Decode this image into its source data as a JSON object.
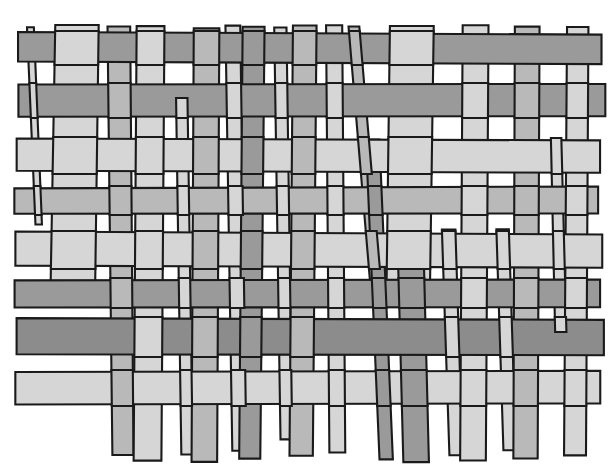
{
  "artwork": {
    "title": "Woven Basket Weave Pattern",
    "type": "illustration",
    "description": "Hand-drawn plain weave of interlacing vertical and horizontal paper strips",
    "canvas": {
      "width": 615,
      "height": 471,
      "background": "#ffffff"
    },
    "palette": {
      "outline": "#1a1a1a",
      "tone_light": "#d6d6d6",
      "tone_medium": "#b9b9b9",
      "tone_dark": "#9a9a9a",
      "tone_darker": "#8c8c8c",
      "background": "#ffffff"
    },
    "weave": {
      "structure": "plain-weave",
      "vertical_strip_count": 27,
      "horizontal_strip_count": 8,
      "stroke_width": 2.1
    },
    "verticals": [
      {
        "id": "v1",
        "x": 27,
        "w": 7,
        "top": 28,
        "bottom": 225,
        "skew": 9,
        "tone": "#d6d6d6",
        "over": [
          1,
          3,
          5,
          7
        ]
      },
      {
        "id": "v2",
        "x": 55,
        "w": 44,
        "top": 25,
        "bottom": 300,
        "skew": -5,
        "tone": "#d6d6d6",
        "over": [
          0,
          2,
          4,
          6
        ]
      },
      {
        "id": "v3",
        "x": 108,
        "w": 22,
        "top": 27,
        "bottom": 455,
        "skew": 4,
        "tone": "#b9b9b9",
        "over": [
          1,
          3,
          5,
          7
        ]
      },
      {
        "id": "v4",
        "x": 137,
        "w": 28,
        "top": 26,
        "bottom": 460,
        "skew": -3,
        "tone": "#d6d6d6",
        "over": [
          0,
          2,
          4,
          6
        ]
      },
      {
        "id": "v5",
        "x": 176,
        "w": 12,
        "top": 100,
        "bottom": 455,
        "skew": 5,
        "tone": "#d6d6d6",
        "over": [
          1,
          3,
          5,
          7
        ]
      },
      {
        "id": "v6",
        "x": 194,
        "w": 25,
        "top": 28,
        "bottom": 462,
        "skew": -2,
        "tone": "#b9b9b9",
        "over": [
          0,
          2,
          4,
          6
        ]
      },
      {
        "id": "v7",
        "x": 226,
        "w": 14,
        "top": 26,
        "bottom": 450,
        "skew": 6,
        "tone": "#d6d6d6",
        "over": [
          1,
          3,
          5,
          7
        ]
      },
      {
        "id": "v8",
        "x": 243,
        "w": 22,
        "top": 27,
        "bottom": 458,
        "skew": -4,
        "tone": "#9a9a9a",
        "over": [
          0,
          2,
          4,
          6
        ]
      },
      {
        "id": "v9",
        "x": 274,
        "w": 12,
        "top": 28,
        "bottom": 440,
        "skew": 7,
        "tone": "#d6d6d6",
        "over": [
          1,
          3,
          5,
          7
        ]
      },
      {
        "id": "v10",
        "x": 293,
        "w": 24,
        "top": 25,
        "bottom": 456,
        "skew": -3,
        "tone": "#b9b9b9",
        "over": [
          0,
          2,
          4,
          6
        ]
      },
      {
        "id": "v11",
        "x": 326,
        "w": 16,
        "top": 26,
        "bottom": 452,
        "skew": 3,
        "tone": "#d6d6d6",
        "over": [
          1,
          3,
          5,
          7
        ]
      },
      {
        "id": "v12",
        "x": 349,
        "w": 10,
        "top": 27,
        "bottom": 300,
        "skew": 22,
        "tone": "#b9b9b9",
        "over": [
          0,
          2,
          4,
          6
        ]
      },
      {
        "id": "v13",
        "x": 366,
        "w": 14,
        "top": 140,
        "bottom": 460,
        "skew": 14,
        "tone": "#9a9a9a",
        "over": [
          1,
          3,
          5,
          7
        ]
      },
      {
        "id": "v14",
        "x": 390,
        "w": 44,
        "top": 26,
        "bottom": 300,
        "skew": -4,
        "tone": "#d6d6d6",
        "over": [
          0,
          2,
          4,
          6
        ]
      },
      {
        "id": "v15",
        "x": 398,
        "w": 26,
        "top": 250,
        "bottom": 462,
        "skew": 5,
        "tone": "#9a9a9a",
        "over": [
          1,
          3,
          5,
          7
        ]
      },
      {
        "id": "v16",
        "x": 442,
        "w": 13,
        "top": 230,
        "bottom": 455,
        "skew": 8,
        "tone": "#d6d6d6",
        "over": [
          0,
          2,
          4,
          6
        ]
      },
      {
        "id": "v17",
        "x": 463,
        "w": 26,
        "top": 25,
        "bottom": 460,
        "skew": -3,
        "tone": "#d6d6d6",
        "over": [
          1,
          3,
          5,
          7
        ]
      },
      {
        "id": "v18",
        "x": 497,
        "w": 12,
        "top": 230,
        "bottom": 450,
        "skew": 6,
        "tone": "#d6d6d6",
        "over": [
          0,
          2,
          4,
          6
        ]
      },
      {
        "id": "v19",
        "x": 515,
        "w": 24,
        "top": 26,
        "bottom": 458,
        "skew": -2,
        "tone": "#b9b9b9",
        "over": [
          1,
          3,
          5,
          7
        ]
      },
      {
        "id": "v20",
        "x": 551,
        "w": 11,
        "top": 140,
        "bottom": 330,
        "skew": 4,
        "tone": "#d6d6d6",
        "over": [
          0,
          2,
          4,
          6
        ]
      },
      {
        "id": "v21",
        "x": 567,
        "w": 22,
        "top": 27,
        "bottom": 455,
        "skew": -3,
        "tone": "#d6d6d6",
        "over": [
          1,
          3,
          5,
          7
        ]
      }
    ],
    "horizontals": [
      {
        "id": "h1",
        "y": 32,
        "h": 30,
        "left": 18,
        "right": 601,
        "skew": 2,
        "tone": "#9a9a9a"
      },
      {
        "id": "h2",
        "y": 85,
        "h": 32,
        "left": 18,
        "right": 605,
        "skew": -1,
        "tone": "#9a9a9a"
      },
      {
        "id": "h3",
        "y": 138,
        "h": 33,
        "left": 16,
        "right": 600,
        "skew": 2,
        "tone": "#d6d6d6"
      },
      {
        "id": "h4",
        "y": 188,
        "h": 26,
        "left": 14,
        "right": 598,
        "skew": -1,
        "tone": "#b9b9b9"
      },
      {
        "id": "h5",
        "y": 232,
        "h": 34,
        "left": 16,
        "right": 602,
        "skew": 2,
        "tone": "#d6d6d6"
      },
      {
        "id": "h6",
        "y": 280,
        "h": 27,
        "left": 14,
        "right": 600,
        "skew": -1,
        "tone": "#9a9a9a"
      },
      {
        "id": "h7",
        "y": 318,
        "h": 36,
        "left": 16,
        "right": 604,
        "skew": 2,
        "tone": "#8c8c8c"
      },
      {
        "id": "h8",
        "y": 372,
        "h": 33,
        "left": 15,
        "right": 600,
        "skew": -1,
        "tone": "#d6d6d6"
      }
    ]
  }
}
